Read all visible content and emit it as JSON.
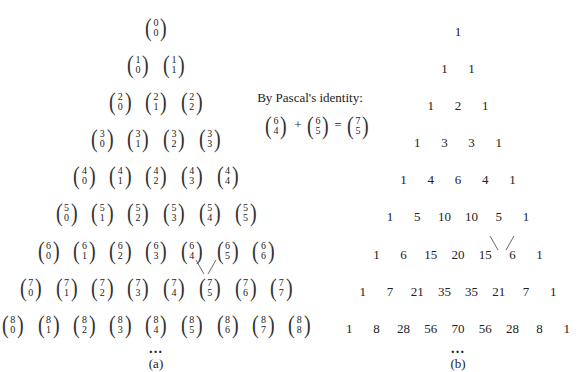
{
  "panel_a": {
    "label": "(a)",
    "rows": [
      [
        [
          0,
          0
        ]
      ],
      [
        [
          1,
          0
        ],
        [
          1,
          1
        ]
      ],
      [
        [
          2,
          0
        ],
        [
          2,
          1
        ],
        [
          2,
          2
        ]
      ],
      [
        [
          3,
          0
        ],
        [
          3,
          1
        ],
        [
          3,
          2
        ],
        [
          3,
          3
        ]
      ],
      [
        [
          4,
          0
        ],
        [
          4,
          1
        ],
        [
          4,
          2
        ],
        [
          4,
          3
        ],
        [
          4,
          4
        ]
      ],
      [
        [
          5,
          0
        ],
        [
          5,
          1
        ],
        [
          5,
          2
        ],
        [
          5,
          3
        ],
        [
          5,
          4
        ],
        [
          5,
          5
        ]
      ],
      [
        [
          6,
          0
        ],
        [
          6,
          1
        ],
        [
          6,
          2
        ],
        [
          6,
          3
        ],
        [
          6,
          4
        ],
        [
          6,
          5
        ],
        [
          6,
          6
        ]
      ],
      [
        [
          7,
          0
        ],
        [
          7,
          1
        ],
        [
          7,
          2
        ],
        [
          7,
          3
        ],
        [
          7,
          4
        ],
        [
          7,
          5
        ],
        [
          7,
          6
        ],
        [
          7,
          7
        ]
      ],
      [
        [
          8,
          0
        ],
        [
          8,
          1
        ],
        [
          8,
          2
        ],
        [
          8,
          3
        ],
        [
          8,
          4
        ],
        [
          8,
          5
        ],
        [
          8,
          6
        ],
        [
          8,
          7
        ],
        [
          8,
          8
        ]
      ]
    ],
    "ellipsis": "…"
  },
  "identity": {
    "caption": "By Pascal's identity:",
    "lhs1": [
      6,
      4
    ],
    "plus": "+",
    "lhs2": [
      6,
      5
    ],
    "equals": "=",
    "rhs": [
      7,
      5
    ]
  },
  "panel_b": {
    "label": "(b)",
    "rows": [
      [
        1
      ],
      [
        1,
        1
      ],
      [
        1,
        2,
        1
      ],
      [
        1,
        3,
        3,
        1
      ],
      [
        1,
        4,
        6,
        4,
        1
      ],
      [
        1,
        5,
        10,
        10,
        5,
        1
      ],
      [
        1,
        6,
        15,
        20,
        15,
        6,
        1
      ],
      [
        1,
        7,
        21,
        35,
        35,
        21,
        7,
        1
      ],
      [
        1,
        8,
        28,
        56,
        70,
        56,
        28,
        8,
        1
      ]
    ],
    "ellipsis": "…"
  }
}
